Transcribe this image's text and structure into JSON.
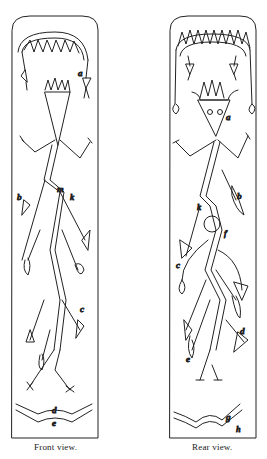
{
  "figure": {
    "panels": [
      {
        "caption": "Front view.",
        "labels": [
          "a",
          "b",
          "m",
          "k",
          "c",
          "d",
          "e"
        ]
      },
      {
        "caption": "Rear view.",
        "labels": [
          "a",
          "b",
          "k",
          "f",
          "c",
          "d",
          "e",
          "g",
          "h"
        ]
      }
    ]
  },
  "colors": {
    "ink": "#222222",
    "paper": "#ffffff"
  }
}
